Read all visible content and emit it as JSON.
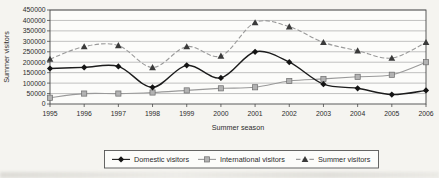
{
  "figure": {
    "ylabel": "Summer visitors",
    "xlabel": "Summer season"
  },
  "chart_data": {
    "type": "line",
    "title": "",
    "xlabel": "Summer season",
    "ylabel": "Summer visitors",
    "x": [
      "1995",
      "1996",
      "1997",
      "1998",
      "1999",
      "2000",
      "2001",
      "2002",
      "2003",
      "2004",
      "2005",
      "2006"
    ],
    "ylim": [
      0,
      450000
    ],
    "ytick_step": 50000,
    "yticks": [
      "0",
      "50000",
      "100000",
      "150000",
      "200000",
      "250000",
      "300000",
      "350000",
      "400000",
      "450000"
    ],
    "grid": true,
    "legend_position": "bottom",
    "colors": {
      "domestic_line": "#1c1c1c",
      "international_line": "#9a9a9a",
      "summer_line": "#9a9a9a",
      "grid_line": "#a8a8a8",
      "axis_line": "#4a4a4a",
      "plot_fill": "#fcfcfa",
      "legend_border": "#555555"
    },
    "series": [
      {
        "name": "Domestic visitors",
        "marker": "diamond",
        "line_style": "solid",
        "color": "#1c1c1c",
        "marker_color": "#141414",
        "values": [
          170000,
          175000,
          180000,
          80000,
          185000,
          125000,
          250000,
          200000,
          95000,
          75000,
          45000,
          65000
        ]
      },
      {
        "name": "International visitors",
        "marker": "square",
        "line_style": "solid",
        "color": "#9a9a9a",
        "marker_color": "#b2b2b2",
        "values": [
          30000,
          50000,
          50000,
          55000,
          65000,
          75000,
          80000,
          110000,
          120000,
          130000,
          140000,
          200000
        ]
      },
      {
        "name": "Summer visitors",
        "marker": "triangle",
        "line_style": "dashed",
        "color": "#9a9a9a",
        "marker_color": "#3a3a3a",
        "values": [
          215000,
          275000,
          280000,
          175000,
          275000,
          230000,
          390000,
          370000,
          295000,
          255000,
          220000,
          295000
        ]
      }
    ]
  }
}
